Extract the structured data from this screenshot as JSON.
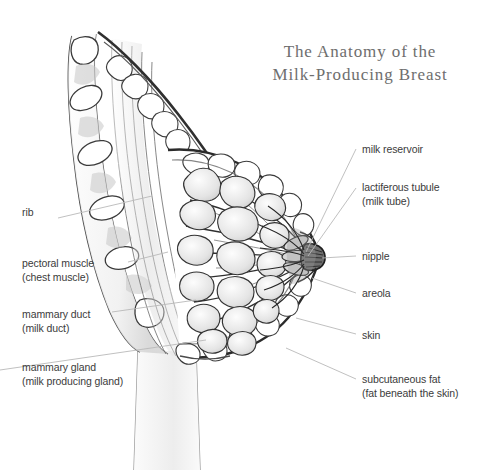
{
  "title": {
    "line1": "The Anatomy of the",
    "line2": "Milk-Producing Breast"
  },
  "colors": {
    "background": "#ffffff",
    "title_text": "#6e6e6e",
    "label_text": "#3b3b3b",
    "leader_line": "#b9b9b9",
    "ink_outline": "#2b2b2b",
    "tissue_fill": "#f2f2f2",
    "muscle_shade": "#cfcfcf",
    "fat_shade": "#e6e6e6"
  },
  "labels": {
    "left": [
      {
        "id": "rib",
        "name": "rib",
        "primary": "rib",
        "secondary": "",
        "x": 22,
        "y": 212,
        "leader": {
          "x1": 58,
          "y1": 218,
          "x2": 152,
          "y2": 196
        }
      },
      {
        "id": "pectoral-muscle",
        "name": "pectoral muscle",
        "primary": "pectoral muscle",
        "secondary": "(chest muscle)",
        "x": 22,
        "y": 258,
        "leader": {
          "x1": 128,
          "y1": 262,
          "x2": 168,
          "y2": 252
        }
      },
      {
        "id": "mammary-duct",
        "name": "mammary duct",
        "primary": "mammary duct",
        "secondary": "(milk duct)",
        "x": 22,
        "y": 309,
        "leader": {
          "x1": 112,
          "y1": 312,
          "x2": 196,
          "y2": 300
        }
      },
      {
        "id": "mammary-gland",
        "name": "mammary gland",
        "primary": "mammary gland",
        "secondary": "(milk producing gland)",
        "x": 22,
        "y": 362,
        "leader": {
          "x1": 0,
          "y1": 370,
          "x2": 206,
          "y2": 340
        }
      }
    ],
    "right": [
      {
        "id": "milk-reservoir",
        "name": "milk reservoir",
        "primary": "milk reservoir",
        "secondary": "",
        "x": 362,
        "y": 144,
        "leader": {
          "x1": 356,
          "y1": 149,
          "x2": 306,
          "y2": 252
        }
      },
      {
        "id": "lactiferous-tubule",
        "name": "lactiferous tubule",
        "primary": "lactiferous tubule",
        "secondary": "(milk tube)",
        "x": 362,
        "y": 182,
        "leader": {
          "x1": 356,
          "y1": 188,
          "x2": 308,
          "y2": 256
        }
      },
      {
        "id": "nipple",
        "name": "nipple",
        "primary": "nipple",
        "secondary": "",
        "x": 362,
        "y": 251,
        "leader": {
          "x1": 356,
          "y1": 256,
          "x2": 322,
          "y2": 258
        }
      },
      {
        "id": "areola",
        "name": "areola",
        "primary": "areola",
        "secondary": "",
        "x": 362,
        "y": 288,
        "leader": {
          "x1": 356,
          "y1": 293,
          "x2": 312,
          "y2": 278
        }
      },
      {
        "id": "skin",
        "name": "skin",
        "primary": "skin",
        "secondary": "",
        "x": 362,
        "y": 330,
        "leader": {
          "x1": 356,
          "y1": 334,
          "x2": 296,
          "y2": 318
        }
      },
      {
        "id": "subcutaneous-fat",
        "name": "subcutaneous fat",
        "primary": "subcutaneous fat",
        "secondary": "(fat beneath the skin)",
        "x": 362,
        "y": 374,
        "leader": {
          "x1": 356,
          "y1": 379,
          "x2": 286,
          "y2": 348
        }
      }
    ]
  },
  "figure": {
    "type": "anatomical-cross-section",
    "view": "sagittal cross-section of female chest wall and breast",
    "structures": [
      "rib cage cross-section",
      "intercostal tissue",
      "pectoral muscle fibers",
      "mammary glands (lobules)",
      "mammary ducts",
      "lactiferous tubules",
      "milk reservoir",
      "nipple",
      "areola",
      "subcutaneous fat",
      "skin"
    ]
  }
}
